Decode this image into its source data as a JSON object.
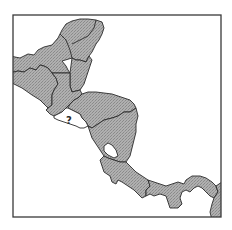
{
  "map": {
    "region": "Central America",
    "frame": {
      "x": 13,
      "y": 15,
      "width": 208,
      "height": 202
    },
    "colors": {
      "land_fill": "#a9a9a9",
      "land_hatch": "#8c8c8c",
      "border": "#2b2b2b",
      "water": "#ffffff",
      "highlighted_country_fill": "#ffffff",
      "frame": "#3a3a3a"
    },
    "countries": [
      {
        "name": "Mexico",
        "filled": true
      },
      {
        "name": "Belize",
        "filled": true
      },
      {
        "name": "Guatemala",
        "filled": true
      },
      {
        "name": "El Salvador",
        "filled": false,
        "label": "?"
      },
      {
        "name": "Honduras",
        "filled": true
      },
      {
        "name": "Nicaragua",
        "filled": true
      },
      {
        "name": "Costa Rica",
        "filled": true
      },
      {
        "name": "Panama",
        "filled": true
      },
      {
        "name": "Colombia",
        "filled": true
      }
    ],
    "lakes": [
      {
        "name": "Lake Nicaragua"
      }
    ],
    "unknown_label": "?"
  }
}
